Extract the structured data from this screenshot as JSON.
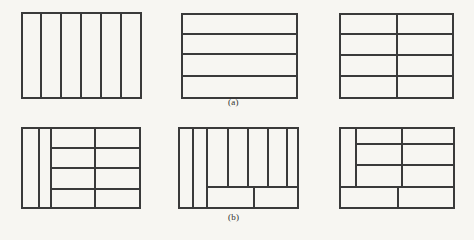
{
  "figure": {
    "background_color": "#f7f6f2",
    "line_color": "#3a3a3a",
    "outer_stroke_width": 1.6,
    "inner_stroke_width": 1.2,
    "caption_a": "(a)",
    "caption_b": "(b)",
    "caption_a_position": {
      "x": 228,
      "y": 97
    },
    "caption_b_position": {
      "x": 228,
      "y": 212
    },
    "rows": [
      {
        "name": "row-a",
        "caption": "(a)",
        "diagrams": [
          {
            "name": "diagram-a1",
            "description": "rectangle sliced into six vertical strips",
            "outer": {
              "x": 22,
              "y": 13,
              "w": 119,
              "h": 85
            },
            "segments": [
              {
                "orientation": "vertical",
                "x1": 41,
                "y1": 13,
                "x2": 41,
                "y2": 98
              },
              {
                "orientation": "vertical",
                "x1": 61,
                "y1": 13,
                "x2": 61,
                "y2": 98
              },
              {
                "orientation": "vertical",
                "x1": 81,
                "y1": 13,
                "x2": 81,
                "y2": 98
              },
              {
                "orientation": "vertical",
                "x1": 101,
                "y1": 13,
                "x2": 101,
                "y2": 98
              },
              {
                "orientation": "vertical",
                "x1": 121,
                "y1": 13,
                "x2": 121,
                "y2": 98
              }
            ]
          },
          {
            "name": "diagram-a2",
            "description": "rectangle sliced into four horizontal bands",
            "outer": {
              "x": 182,
              "y": 14,
              "w": 115,
              "h": 84
            },
            "segments": [
              {
                "orientation": "horizontal",
                "x1": 182,
                "y1": 34,
                "x2": 297,
                "y2": 34
              },
              {
                "orientation": "horizontal",
                "x1": 182,
                "y1": 54,
                "x2": 297,
                "y2": 54
              },
              {
                "orientation": "horizontal",
                "x1": 182,
                "y1": 76,
                "x2": 297,
                "y2": 76
              }
            ]
          },
          {
            "name": "diagram-a3",
            "description": "four horizontal bands crossed by one full-height vertical divider",
            "outer": {
              "x": 340,
              "y": 14,
              "w": 113,
              "h": 84
            },
            "segments": [
              {
                "orientation": "horizontal",
                "x1": 340,
                "y1": 34,
                "x2": 453,
                "y2": 34
              },
              {
                "orientation": "horizontal",
                "x1": 340,
                "y1": 55,
                "x2": 453,
                "y2": 55
              },
              {
                "orientation": "horizontal",
                "x1": 340,
                "y1": 76,
                "x2": 453,
                "y2": 76
              },
              {
                "orientation": "vertical",
                "x1": 397,
                "y1": 14,
                "x2": 397,
                "y2": 98
              }
            ]
          }
        ]
      },
      {
        "name": "row-b",
        "caption": "(b)",
        "diagrams": [
          {
            "name": "diagram-b1",
            "description": "two narrow full-height strips at left plus a four-by-two grid at right",
            "outer": {
              "x": 22,
              "y": 128,
              "w": 118,
              "h": 80
            },
            "segments": [
              {
                "orientation": "vertical",
                "x1": 39,
                "y1": 128,
                "x2": 39,
                "y2": 208
              },
              {
                "orientation": "vertical",
                "x1": 51,
                "y1": 128,
                "x2": 51,
                "y2": 208
              },
              {
                "orientation": "vertical",
                "x1": 95,
                "y1": 128,
                "x2": 95,
                "y2": 208
              },
              {
                "orientation": "horizontal",
                "x1": 51,
                "y1": 148,
                "x2": 140,
                "y2": 148
              },
              {
                "orientation": "horizontal",
                "x1": 51,
                "y1": 168,
                "x2": 140,
                "y2": 168
              },
              {
                "orientation": "horizontal",
                "x1": 51,
                "y1": 189,
                "x2": 140,
                "y2": 189
              }
            ]
          },
          {
            "name": "diagram-b2",
            "description": "two narrow full-height strips, five tall vertical strips above a two-cell bottom band",
            "outer": {
              "x": 179,
              "y": 128,
              "w": 119,
              "h": 80
            },
            "segments": [
              {
                "orientation": "vertical",
                "x1": 193,
                "y1": 128,
                "x2": 193,
                "y2": 208
              },
              {
                "orientation": "vertical",
                "x1": 207,
                "y1": 128,
                "x2": 207,
                "y2": 208
              },
              {
                "orientation": "vertical",
                "x1": 228,
                "y1": 128,
                "x2": 228,
                "y2": 187
              },
              {
                "orientation": "vertical",
                "x1": 248,
                "y1": 128,
                "x2": 248,
                "y2": 187
              },
              {
                "orientation": "vertical",
                "x1": 268,
                "y1": 128,
                "x2": 268,
                "y2": 187
              },
              {
                "orientation": "vertical",
                "x1": 287,
                "y1": 128,
                "x2": 287,
                "y2": 187
              },
              {
                "orientation": "horizontal",
                "x1": 207,
                "y1": 187,
                "x2": 298,
                "y2": 187
              },
              {
                "orientation": "vertical",
                "x1": 254,
                "y1": 187,
                "x2": 254,
                "y2": 208
              }
            ]
          },
          {
            "name": "diagram-b3",
            "description": "narrow left strip, two columns of three rows, and a two-cell bottom band",
            "outer": {
              "x": 340,
              "y": 128,
              "w": 114,
              "h": 80
            },
            "segments": [
              {
                "orientation": "vertical",
                "x1": 356,
                "y1": 128,
                "x2": 356,
                "y2": 187
              },
              {
                "orientation": "vertical",
                "x1": 402,
                "y1": 128,
                "x2": 402,
                "y2": 187
              },
              {
                "orientation": "horizontal",
                "x1": 356,
                "y1": 144,
                "x2": 454,
                "y2": 144
              },
              {
                "orientation": "horizontal",
                "x1": 356,
                "y1": 165,
                "x2": 454,
                "y2": 165
              },
              {
                "orientation": "horizontal",
                "x1": 340,
                "y1": 187,
                "x2": 454,
                "y2": 187
              },
              {
                "orientation": "vertical",
                "x1": 398,
                "y1": 187,
                "x2": 398,
                "y2": 208
              }
            ]
          }
        ]
      }
    ]
  }
}
